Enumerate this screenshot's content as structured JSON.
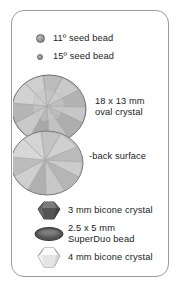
{
  "panel": {
    "title": "beading materials legend",
    "border_color": "#9a9a9a",
    "background_color": "#ffffff"
  },
  "legend": {
    "items": [
      {
        "id": "seed-bead-11",
        "icon": "small-round-bead-icon",
        "label": "11º seed bead",
        "swatch_color": "#9d9d9d"
      },
      {
        "id": "seed-bead-15",
        "icon": "tiny-round-bead-icon",
        "label": "15º seed bead",
        "swatch_color": "#9d9d9d"
      },
      {
        "id": "oval-crystal-front",
        "icon": "faceted-oval-crystal-icon",
        "label": "18 x 13 mm\noval crystal",
        "swatch_color": "#b4b4b4"
      },
      {
        "id": "oval-crystal-back",
        "icon": "faceted-oval-crystal-back-icon",
        "label": "-back surface",
        "swatch_color": "#b0b0b0"
      },
      {
        "id": "bicone-crystal-3mm",
        "icon": "dark-bicone-crystal-icon",
        "label": "3 mm bicone crystal",
        "swatch_color": "#5e5e5e"
      },
      {
        "id": "superduo-bead",
        "icon": "superduo-lens-bead-icon",
        "label": "2.5 x 5 mm\nSuperDuo bead",
        "swatch_color": "#585858"
      },
      {
        "id": "bicone-crystal-4mm",
        "icon": "light-bicone-crystal-icon",
        "label": "4 mm bicone crystal",
        "swatch_color": "#e4e4e4"
      }
    ]
  }
}
